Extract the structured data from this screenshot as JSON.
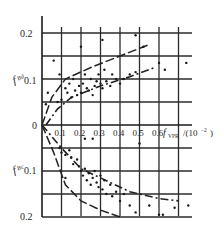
{
  "chart_data": [
    {
      "type": "scatter",
      "panel": "upper",
      "title": "",
      "xlabel": "f_VPR/(10^-2)",
      "ylabel": "f_Bd",
      "x_ticks": [
        "0.1",
        "0.2",
        "0.3",
        "0.4",
        "0.5",
        "0.6"
      ],
      "y_ticks": [
        "0.1",
        "0.2"
      ],
      "xlim": [
        0,
        0.75
      ],
      "ylim": [
        0,
        0.2
      ],
      "grid": true,
      "origin_label": "0",
      "series": [
        {
          "name": "measured",
          "points": [
            [
              0.02,
              0.045
            ],
            [
              0.03,
              0.07
            ],
            [
              0.06,
              0.14
            ],
            [
              0.08,
              0.05
            ],
            [
              0.09,
              0.11
            ],
            [
              0.1,
              0.055
            ],
            [
              0.12,
              0.08
            ],
            [
              0.13,
              0.07
            ],
            [
              0.14,
              0.09
            ],
            [
              0.15,
              0.06
            ],
            [
              0.16,
              0.1
            ],
            [
              0.17,
              0.075
            ],
            [
              0.18,
              0.065
            ],
            [
              0.19,
              0.085
            ],
            [
              0.2,
              0.07
            ],
            [
              0.21,
              0.09
            ],
            [
              0.22,
              0.11
            ],
            [
              0.23,
              0.08
            ],
            [
              0.24,
              0.075
            ],
            [
              0.25,
              0.1
            ],
            [
              0.26,
              0.065
            ],
            [
              0.27,
              0.085
            ],
            [
              0.28,
              0.095
            ],
            [
              0.29,
              0.11
            ],
            [
              0.3,
              0.09
            ],
            [
              0.31,
              0.08
            ],
            [
              0.32,
              0.12
            ],
            [
              0.33,
              0.095
            ],
            [
              0.35,
              0.085
            ],
            [
              0.36,
              0.11
            ],
            [
              0.38,
              0.1
            ],
            [
              0.4,
              0.09
            ],
            [
              0.42,
              0.1
            ],
            [
              0.45,
              0.11
            ],
            [
              0.48,
              0.115
            ],
            [
              0.2,
              0.17
            ],
            [
              0.31,
              0.185
            ],
            [
              0.48,
              0.195
            ],
            [
              0.52,
              0.17
            ],
            [
              0.6,
              0.135
            ],
            [
              0.63,
              0.12
            ],
            [
              0.74,
              0.135
            ]
          ]
        },
        {
          "name": "upper bound (dashed)",
          "line": [
            [
              0.0,
              0.0
            ],
            [
              0.05,
              0.06
            ],
            [
              0.12,
              0.1
            ],
            [
              0.25,
              0.125
            ],
            [
              0.4,
              0.15
            ],
            [
              0.55,
              0.175
            ]
          ]
        },
        {
          "name": "lower bound (dash-dot)",
          "line": [
            [
              0.02,
              0.0
            ],
            [
              0.08,
              0.035
            ],
            [
              0.15,
              0.06
            ],
            [
              0.3,
              0.085
            ],
            [
              0.45,
              0.105
            ],
            [
              0.58,
              0.125
            ]
          ]
        }
      ]
    },
    {
      "type": "scatter",
      "panel": "lower",
      "title": "",
      "xlabel": "f_VPR/(10^-2)",
      "ylabel": "f_Bc",
      "x_ticks": [
        "0.1",
        "0.2",
        "0.3",
        "0.4",
        "0.5",
        "0.6"
      ],
      "y_ticks": [
        "0.1",
        "0.2"
      ],
      "xlim": [
        0,
        0.75
      ],
      "ylim": [
        0.2,
        0
      ],
      "grid": true,
      "series": [
        {
          "name": "measured",
          "points": [
            [
              0.09,
              0.05
            ],
            [
              0.1,
              0.06
            ],
            [
              0.12,
              0.065
            ],
            [
              0.14,
              0.055
            ],
            [
              0.15,
              0.07
            ],
            [
              0.16,
              0.085
            ],
            [
              0.18,
              0.075
            ],
            [
              0.19,
              0.09
            ],
            [
              0.2,
              0.1
            ],
            [
              0.21,
              0.11
            ],
            [
              0.22,
              0.095
            ],
            [
              0.23,
              0.12
            ],
            [
              0.24,
              0.105
            ],
            [
              0.25,
              0.13
            ],
            [
              0.26,
              0.115
            ],
            [
              0.27,
              0.1
            ],
            [
              0.28,
              0.125
            ],
            [
              0.29,
              0.135
            ],
            [
              0.3,
              0.11
            ],
            [
              0.31,
              0.14
            ],
            [
              0.32,
              0.12
            ],
            [
              0.33,
              0.15
            ],
            [
              0.35,
              0.13
            ],
            [
              0.36,
              0.155
            ],
            [
              0.38,
              0.145
            ],
            [
              0.4,
              0.165
            ],
            [
              0.42,
              0.15
            ],
            [
              0.45,
              0.175
            ],
            [
              0.48,
              0.19
            ],
            [
              0.22,
              0.03
            ],
            [
              0.26,
              0.03
            ],
            [
              0.5,
              0.04
            ],
            [
              0.55,
              0.175
            ],
            [
              0.6,
              0.195
            ],
            [
              0.62,
              0.195
            ],
            [
              0.68,
              0.18
            ],
            [
              0.75,
              0.175
            ],
            [
              0.12,
              0.115
            ]
          ]
        },
        {
          "name": "upper curve (dash-dot)",
          "line": [
            [
              0.0,
              0.0
            ],
            [
              0.1,
              0.05
            ],
            [
              0.2,
              0.095
            ],
            [
              0.3,
              0.115
            ],
            [
              0.45,
              0.145
            ],
            [
              0.6,
              0.16
            ],
            [
              0.7,
              0.165
            ]
          ]
        },
        {
          "name": "lower curve (dashed)",
          "line": [
            [
              0.0,
              0.0
            ],
            [
              0.06,
              0.06
            ],
            [
              0.12,
              0.13
            ],
            [
              0.2,
              0.165
            ],
            [
              0.3,
              0.185
            ],
            [
              0.4,
              0.2
            ]
          ]
        }
      ]
    }
  ],
  "labels": {
    "y_top_upper": "0.2",
    "y_mid_upper": "0.1",
    "y_mid_lower": "0.1",
    "y_bottom_lower": "0.2",
    "origin": "0",
    "ylabel_upper": "f",
    "ylabel_upper_sub": "Bd",
    "ylabel_lower": "f",
    "ylabel_lower_sub": "Bc",
    "x_ticks": [
      "0.1",
      "0.2",
      "0.3",
      "0.4",
      "0.5",
      "0.6"
    ],
    "xlabel_f": "f",
    "xlabel_sub": "VPR",
    "xlabel_unit": "/(10",
    "xlabel_exp": "−2",
    "xlabel_close": ")"
  }
}
